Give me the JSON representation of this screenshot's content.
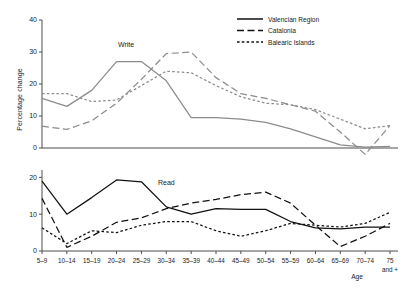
{
  "chart_data": {
    "type": "line",
    "title": "",
    "xlabel": "Age",
    "ylabel": "Percentage change",
    "grid": false,
    "legend_position": "top-right",
    "categories": [
      "5–9",
      "10–14",
      "15–19",
      "20–24",
      "25–29",
      "30–34",
      "35–39",
      "40–44",
      "45–49",
      "50–54",
      "55–59",
      "60–64",
      "65–69",
      "70–74",
      "75 and +"
    ],
    "panels": [
      {
        "name": "Write",
        "annotation": "Write",
        "ylim": [
          0,
          40
        ],
        "yticks": [
          0,
          10,
          20,
          30,
          40
        ],
        "series": [
          {
            "name": "Valencian Region",
            "style": "solid",
            "values": [
              15.5,
              13.0,
              18.0,
              27.0,
              27.0,
              21.0,
              9.5,
              9.5,
              9.0,
              8.0,
              6.0,
              3.5,
              1.0,
              0.3,
              0.5
            ]
          },
          {
            "name": "Catalonia",
            "style": "long-dash",
            "values": [
              6.8,
              5.8,
              8.5,
              14.0,
              21.5,
              29.5,
              30.0,
              22.0,
              17.0,
              15.5,
              13.5,
              11.5,
              5.0,
              -2.0,
              7.0
            ]
          },
          {
            "name": "Balearic Islands",
            "style": "short-dash",
            "values": [
              17.0,
              17.0,
              14.5,
              15.0,
              19.5,
              24.0,
              23.5,
              19.5,
              16.0,
              14.0,
              13.5,
              12.0,
              9.0,
              6.0,
              7.0
            ]
          }
        ]
      },
      {
        "name": "Read",
        "annotation": "Read",
        "ylim": [
          0,
          22
        ],
        "yticks": [
          0,
          10,
          20
        ],
        "series": [
          {
            "name": "Valencian Region",
            "style": "solid",
            "values": [
              19.0,
              10.0,
              14.5,
              19.3,
              18.8,
              12.0,
              10.0,
              11.5,
              11.3,
              11.3,
              8.0,
              6.3,
              6.0,
              6.5,
              6.5
            ]
          },
          {
            "name": "Catalonia",
            "style": "long-dash",
            "values": [
              14.3,
              1.0,
              4.0,
              7.8,
              9.0,
              11.5,
              13.0,
              14.0,
              15.3,
              16.0,
              13.0,
              7.0,
              1.2,
              4.0,
              7.5
            ]
          },
          {
            "name": "Balearic Islands",
            "style": "short-dash",
            "values": [
              6.3,
              2.0,
              5.5,
              5.0,
              7.0,
              8.0,
              8.0,
              5.5,
              4.0,
              5.5,
              7.5,
              7.0,
              6.5,
              7.5,
              10.5
            ]
          }
        ]
      }
    ]
  },
  "axes": {
    "y_label": "Percentage change",
    "x_label": "Age",
    "top_yticks": [
      "0",
      "10",
      "20",
      "30",
      "40"
    ],
    "bottom_yticks": [
      "0",
      "10",
      "20"
    ],
    "xtick_labels": [
      "5–9",
      "10–14",
      "15–19",
      "20–24",
      "25–29",
      "30–34",
      "35–39",
      "40–44",
      "45–49",
      "50–54",
      "55–59",
      "60–64",
      "65–69",
      "70–74",
      "75"
    ],
    "last_tick_second_line": "and +"
  },
  "legend": {
    "items": [
      {
        "label": "Valencian Region",
        "style": "solid"
      },
      {
        "label": "Catalonia",
        "style": "long-dash"
      },
      {
        "label": "Balearic Islands",
        "style": "short-dash"
      }
    ]
  },
  "annotations": {
    "top_panel": "Write",
    "bottom_panel": "Read"
  },
  "colors": {
    "top_panel_line": "#8c8c8c",
    "bottom_panel_line": "#111111",
    "axis": "#4d4d4d",
    "text": "#1a1a1a",
    "background": "#ffffff"
  }
}
